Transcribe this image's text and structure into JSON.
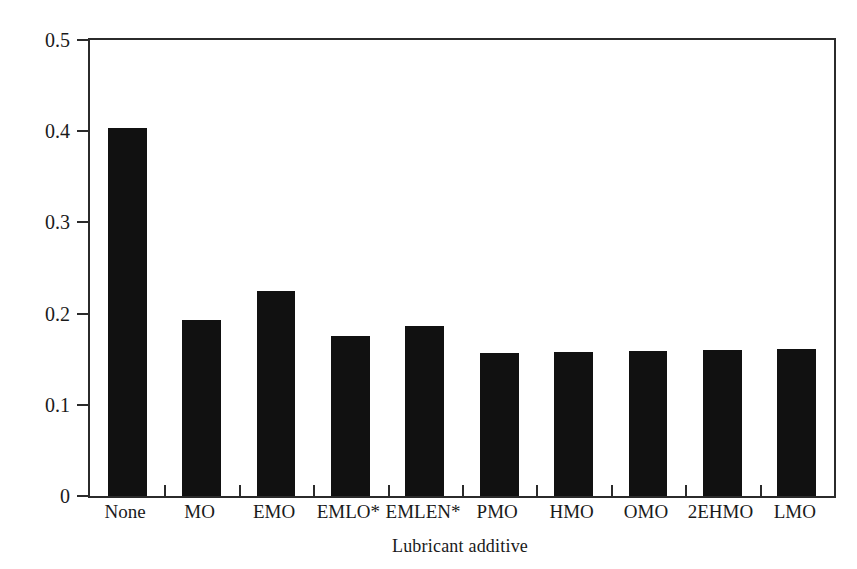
{
  "chart_data": {
    "type": "bar",
    "title": "",
    "xlabel": "Lubricant additive",
    "ylabel": "Coefficient of friction",
    "categories": [
      "None",
      "MO",
      "EMO",
      "EMLO*",
      "EMLEN*",
      "PMO",
      "HMO",
      "OMO",
      "2EHMO",
      "LMO"
    ],
    "values": [
      0.403,
      0.193,
      0.225,
      0.175,
      0.186,
      0.157,
      0.158,
      0.159,
      0.16,
      0.161
    ],
    "ylim": [
      0,
      0.5
    ],
    "yticks": [
      0,
      0.1,
      0.2,
      0.3,
      0.4,
      0.5
    ],
    "ytick_labels": [
      "0",
      "0.1",
      "0.2",
      "0.3",
      "0.4",
      "0.5"
    ],
    "grid": false,
    "legend": false,
    "bar_color": "#111111",
    "axis_color": "#2b2b2b",
    "background": "#ffffff"
  }
}
